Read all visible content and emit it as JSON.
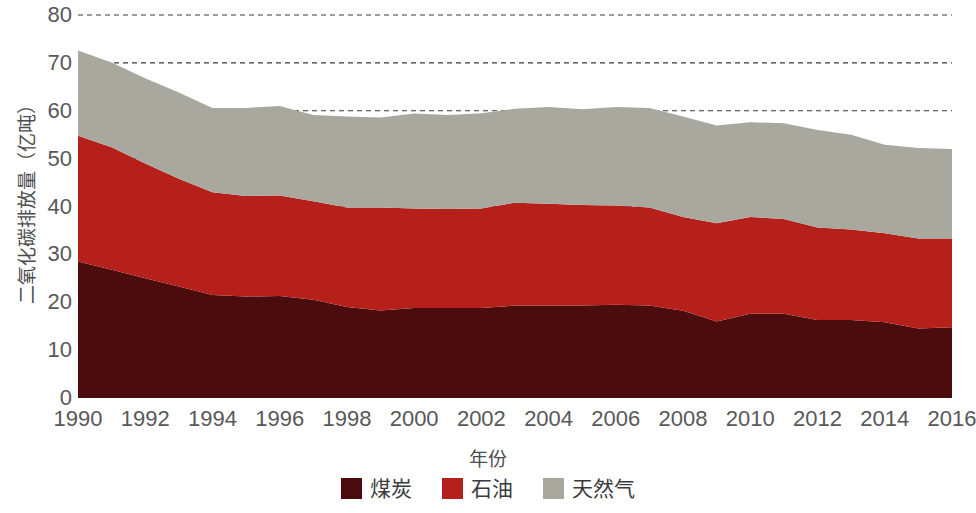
{
  "chart_data": {
    "type": "area",
    "stacked": true,
    "title": "",
    "xlabel": "年份",
    "ylabel": "二氧化碳排放量（亿吨）",
    "xlim": [
      1990,
      2016
    ],
    "ylim": [
      0,
      80
    ],
    "yticks": [
      0,
      10,
      20,
      30,
      40,
      50,
      60,
      70,
      80
    ],
    "xticks": [
      1990,
      1992,
      1994,
      1996,
      1998,
      2000,
      2002,
      2004,
      2006,
      2008,
      2010,
      2012,
      2014,
      2016
    ],
    "grid": "horizontal-dashed",
    "legend_position": "bottom-center",
    "x": [
      1990,
      1991,
      1992,
      1993,
      1994,
      1995,
      1996,
      1997,
      1998,
      1999,
      2000,
      2001,
      2002,
      2003,
      2004,
      2005,
      2006,
      2007,
      2008,
      2009,
      2010,
      2011,
      2012,
      2013,
      2014,
      2015,
      2016
    ],
    "series": [
      {
        "name": "煤炭",
        "color": "#4a0c0c",
        "values": [
          28.5,
          26.8,
          25.0,
          23.3,
          21.5,
          21.2,
          21.3,
          20.5,
          19.0,
          18.3,
          18.8,
          18.8,
          18.8,
          19.3,
          19.3,
          19.3,
          19.5,
          19.3,
          18.2,
          16.0,
          17.6,
          17.6,
          16.3,
          16.3,
          15.8,
          14.5,
          14.8
        ]
      },
      {
        "name": "石油",
        "color": "#b5201a",
        "values": [
          26.3,
          25.6,
          24.0,
          22.5,
          21.5,
          21.0,
          21.0,
          20.6,
          20.8,
          21.5,
          20.8,
          20.7,
          20.8,
          21.5,
          21.3,
          21.0,
          20.7,
          20.5,
          19.6,
          20.5,
          20.2,
          19.8,
          19.3,
          18.9,
          18.6,
          18.8,
          18.5
        ]
      },
      {
        "name": "天然气",
        "color": "#a8a89e",
        "values": [
          17.8,
          17.7,
          17.8,
          18.0,
          17.6,
          18.4,
          18.7,
          18.0,
          19.0,
          18.8,
          19.8,
          19.6,
          19.9,
          19.6,
          20.2,
          20.0,
          20.6,
          20.8,
          21.0,
          20.4,
          19.8,
          20.0,
          20.4,
          19.8,
          18.5,
          18.9,
          18.7
        ]
      }
    ]
  },
  "yticklabels": [
    "80",
    "70",
    "60",
    "50",
    "40",
    "30",
    "20",
    "10",
    "0"
  ],
  "xticklabels": [
    "1990",
    "1992",
    "1994",
    "1996",
    "1998",
    "2000",
    "2002",
    "2004",
    "2006",
    "2008",
    "2010",
    "2012",
    "2014",
    "2016"
  ],
  "legend": {
    "items": [
      {
        "label": "煤炭",
        "color": "#4a0c0c"
      },
      {
        "label": "石油",
        "color": "#b5201a"
      },
      {
        "label": "天然气",
        "color": "#a8a89e"
      }
    ]
  }
}
